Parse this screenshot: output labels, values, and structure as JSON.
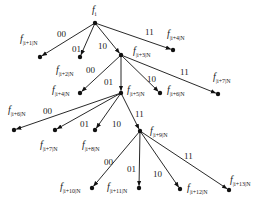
{
  "diagram": {
    "type": "tree",
    "root": "f_i",
    "nodes": [
      {
        "id": "r",
        "label": "f",
        "sub": "i",
        "x": 95,
        "y": 23,
        "lx": 92,
        "ly": 5
      },
      {
        "id": "a",
        "label": "f",
        "sub": "|i+1|N",
        "x": 40,
        "y": 57,
        "lx": 20,
        "ly": 34
      },
      {
        "id": "b",
        "label": "",
        "sub": "",
        "x": 80,
        "y": 57,
        "lx": 0,
        "ly": 0
      },
      {
        "id": "c",
        "label": "f",
        "sub": "|i+3|N",
        "x": 121,
        "y": 55,
        "lx": 133,
        "ly": 46
      },
      {
        "id": "d",
        "label": "f",
        "sub": "|i+4|N",
        "x": 173,
        "y": 50,
        "lx": 167,
        "ly": 29
      },
      {
        "id": "e",
        "label": "f",
        "sub": "|i+4|N",
        "x": 80,
        "y": 93,
        "lx": 52,
        "ly": 85
      },
      {
        "id": "f",
        "label": "f",
        "sub": "|i+5|N",
        "x": 121,
        "y": 93,
        "lx": 127,
        "ly": 85
      },
      {
        "id": "g",
        "label": "f",
        "sub": "|i+6|N",
        "x": 160,
        "y": 93,
        "lx": 167,
        "ly": 85
      },
      {
        "id": "h",
        "label": "f",
        "sub": "|i+7|N",
        "x": 218,
        "y": 94,
        "lx": 213,
        "ly": 72
      },
      {
        "id": "j",
        "label": "f",
        "sub": "|i+6|N",
        "x": 14,
        "y": 130,
        "lx": 8,
        "ly": 105
      },
      {
        "id": "k",
        "label": "f",
        "sub": "|i+7|N",
        "x": 55,
        "y": 130,
        "lx": 40,
        "ly": 140
      },
      {
        "id": "l",
        "label": "f",
        "sub": "|i+8|N",
        "x": 95,
        "y": 130,
        "lx": 82,
        "ly": 140
      },
      {
        "id": "m",
        "label": "f",
        "sub": "|i+9|N",
        "x": 140,
        "y": 131,
        "lx": 150,
        "ly": 126
      },
      {
        "id": "n",
        "label": "f",
        "sub": "|i+10|N",
        "x": 92,
        "y": 188,
        "lx": 60,
        "ly": 182
      },
      {
        "id": "o",
        "label": "f",
        "sub": "|i+11|N",
        "x": 139,
        "y": 188,
        "lx": 107,
        "ly": 182
      },
      {
        "id": "p",
        "label": "f",
        "sub": "|i+12|N",
        "x": 180,
        "y": 189,
        "lx": 187,
        "ly": 183
      },
      {
        "id": "q",
        "label": "f",
        "sub": "|i+13|N",
        "x": 229,
        "y": 190,
        "lx": 230,
        "ly": 175
      },
      {
        "id": "b2",
        "label": "f",
        "sub": "|i+2|N",
        "x": 80,
        "y": 57,
        "lx": 56,
        "ly": 65
      }
    ],
    "edges": [
      {
        "from": "r",
        "to": "a",
        "label": "00",
        "lx": 57,
        "ly": 30
      },
      {
        "from": "r",
        "to": "b",
        "label": "01",
        "lx": 72,
        "ly": 45
      },
      {
        "from": "r",
        "to": "c",
        "label": "10",
        "lx": 98,
        "ly": 42
      },
      {
        "from": "r",
        "to": "d",
        "label": "11",
        "lx": 145,
        "ly": 28
      },
      {
        "from": "c",
        "to": "e",
        "label": "00",
        "lx": 86,
        "ly": 66
      },
      {
        "from": "c",
        "to": "f",
        "label": "01",
        "lx": 104,
        "ly": 78
      },
      {
        "from": "c",
        "to": "g",
        "label": "10",
        "lx": 147,
        "ly": 75
      },
      {
        "from": "c",
        "to": "h",
        "label": "11",
        "lx": 180,
        "ly": 68
      },
      {
        "from": "f",
        "to": "j",
        "label": "00",
        "lx": 43,
        "ly": 107
      },
      {
        "from": "f",
        "to": "k",
        "label": "01",
        "lx": 80,
        "ly": 120
      },
      {
        "from": "f",
        "to": "l",
        "label": "10",
        "lx": 112,
        "ly": 120
      },
      {
        "from": "f",
        "to": "m",
        "label": "11",
        "lx": 135,
        "ly": 110
      },
      {
        "from": "m",
        "to": "n",
        "label": "00",
        "lx": 104,
        "ly": 158
      },
      {
        "from": "m",
        "to": "o",
        "label": "01",
        "lx": 127,
        "ly": 165
      },
      {
        "from": "m",
        "to": "p",
        "label": "10",
        "lx": 153,
        "ly": 170
      },
      {
        "from": "m",
        "to": "q",
        "label": "11",
        "lx": 184,
        "ly": 152
      }
    ]
  }
}
